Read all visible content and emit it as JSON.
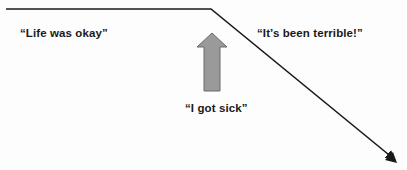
{
  "diagram": {
    "type": "illness-narrative-trajectory",
    "labels": {
      "before": "“Life was okay”",
      "after": "“It’s been terrible!”",
      "event": "“I got sick”"
    },
    "trajectory": {
      "start": [
        6,
        9
      ],
      "turn": [
        211,
        9
      ],
      "end": [
        397,
        162
      ],
      "color": "#1a1a1a"
    },
    "event_arrow": {
      "direction": "up",
      "fill": "#9a9a9a",
      "stroke": "#6a6a6a"
    },
    "icons": {
      "trajectory_arrow": "arrow-down-right-icon",
      "event_arrow": "block-arrow-up-icon"
    }
  }
}
